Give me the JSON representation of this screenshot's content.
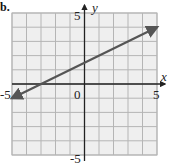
{
  "panel_label": "b.",
  "chart_data": {
    "type": "line",
    "title": "",
    "xlabel": "x",
    "ylabel": "y",
    "xlim": [
      -5,
      5
    ],
    "ylim": [
      -5,
      5
    ],
    "grid": true,
    "tick_labels": {
      "x_min": "-5",
      "x_max": "5",
      "y_min": "-5",
      "y_max": "5",
      "origin": "0"
    },
    "series": [
      {
        "name": "line",
        "equation": "y = 0.5x + 1.5",
        "x": [
          -5,
          5
        ],
        "y": [
          -1,
          4
        ],
        "arrows": "both",
        "color": "#555555"
      }
    ]
  },
  "colors": {
    "grid": "#b5b5b5",
    "grid_bg": "#efefef",
    "axis": "#222222",
    "line": "#555555"
  }
}
